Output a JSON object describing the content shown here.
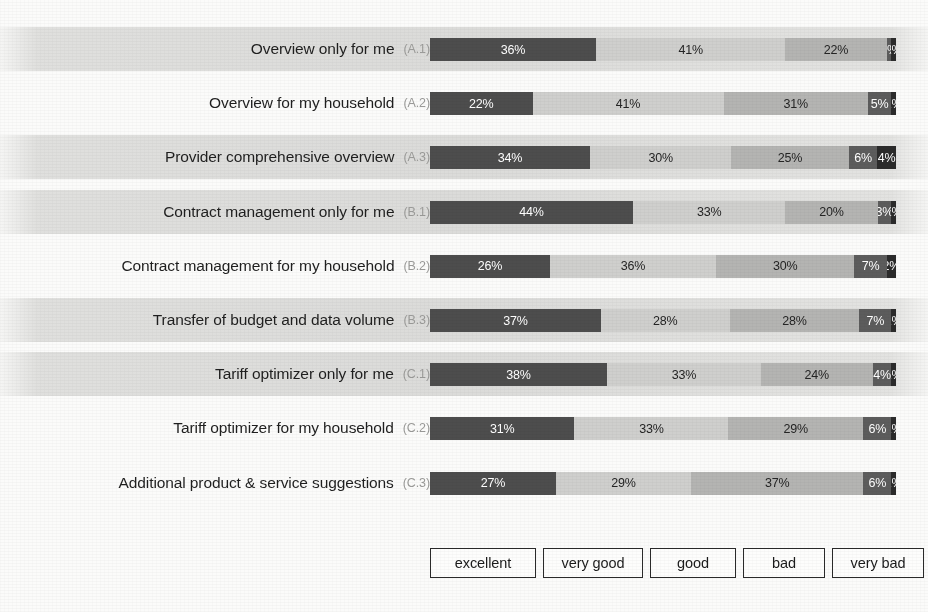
{
  "chart_data": {
    "type": "bar",
    "subtype": "horizontal-100-percent-stacked",
    "title": "",
    "xlabel": "",
    "ylabel": "",
    "xlim": [
      0,
      100
    ],
    "grid": false,
    "legend_position": "bottom",
    "value_suffix": "%",
    "categories": [
      "Overview only for me",
      "Overview for my household",
      "Provider comprehensive overview",
      "Contract management only for me",
      "Contract management for my household",
      "Transfer of budget and data volume",
      "Tariff optimizer only for me",
      "Tariff optimizer for my household",
      "Additional product & service suggestions"
    ],
    "category_codes": [
      "(A.1)",
      "(A.2)",
      "(A.3)",
      "(B.1)",
      "(B.2)",
      "(B.3)",
      "(C.1)",
      "(C.2)",
      "(C.3)"
    ],
    "series": [
      {
        "name": "excellent",
        "color": "#4d4d4d",
        "values": [
          36,
          22,
          34,
          44,
          26,
          37,
          38,
          31,
          27
        ]
      },
      {
        "name": "very good",
        "color": "#cfcfcd",
        "values": [
          41,
          41,
          30,
          33,
          36,
          28,
          33,
          33,
          29
        ]
      },
      {
        "name": "good",
        "color": "#b4b4b2",
        "values": [
          22,
          31,
          25,
          20,
          30,
          28,
          24,
          29,
          37
        ]
      },
      {
        "name": "bad",
        "color": "#5c5c5c",
        "values": [
          1,
          5,
          6,
          3,
          7,
          7,
          4,
          6,
          6
        ]
      },
      {
        "name": "very bad",
        "color": "#2b2b2b",
        "values": [
          1,
          1,
          4,
          1,
          2,
          1,
          1,
          1,
          1
        ]
      }
    ],
    "rows": [
      {
        "label": "Overview only for me",
        "code": "(A.1)",
        "band": true,
        "segments": [
          {
            "series": "excellent",
            "value": 36,
            "label": "36%"
          },
          {
            "series": "very good",
            "value": 41,
            "label": "41%"
          },
          {
            "series": "good",
            "value": 22,
            "label": "22%"
          },
          {
            "series": "bad",
            "value": 1,
            "label": "1%"
          },
          {
            "series": "very bad",
            "value": 1,
            "label": "1%"
          }
        ]
      },
      {
        "label": "Overview for my household",
        "code": "(A.2)",
        "band": false,
        "segments": [
          {
            "series": "excellent",
            "value": 22,
            "label": "22%"
          },
          {
            "series": "very good",
            "value": 41,
            "label": "41%"
          },
          {
            "series": "good",
            "value": 31,
            "label": "31%"
          },
          {
            "series": "bad",
            "value": 5,
            "label": "5%"
          },
          {
            "series": "very bad",
            "value": 1,
            "label": "1%"
          }
        ]
      },
      {
        "label": "Provider comprehensive overview",
        "code": "(A.3)",
        "band": true,
        "segments": [
          {
            "series": "excellent",
            "value": 34,
            "label": "34%"
          },
          {
            "series": "very good",
            "value": 30,
            "label": "30%"
          },
          {
            "series": "good",
            "value": 25,
            "label": "25%"
          },
          {
            "series": "bad",
            "value": 6,
            "label": "6%"
          },
          {
            "series": "very bad",
            "value": 4,
            "label": "4%"
          }
        ]
      },
      {
        "label": "Contract management only for me",
        "code": "(B.1)",
        "band": true,
        "segments": [
          {
            "series": "excellent",
            "value": 44,
            "label": "44%"
          },
          {
            "series": "very good",
            "value": 33,
            "label": "33%"
          },
          {
            "series": "good",
            "value": 20,
            "label": "20%"
          },
          {
            "series": "bad",
            "value": 3,
            "label": "3%"
          },
          {
            "series": "very bad",
            "value": 1,
            "label": "1%"
          }
        ]
      },
      {
        "label": "Contract management for my household",
        "code": "(B.2)",
        "band": false,
        "segments": [
          {
            "series": "excellent",
            "value": 26,
            "label": "26%"
          },
          {
            "series": "very good",
            "value": 36,
            "label": "36%"
          },
          {
            "series": "good",
            "value": 30,
            "label": "30%"
          },
          {
            "series": "bad",
            "value": 7,
            "label": "7%"
          },
          {
            "series": "very bad",
            "value": 2,
            "label": "2%"
          }
        ]
      },
      {
        "label": "Transfer of budget and data volume",
        "code": "(B.3)",
        "band": true,
        "segments": [
          {
            "series": "excellent",
            "value": 37,
            "label": "37%"
          },
          {
            "series": "very good",
            "value": 28,
            "label": "28%"
          },
          {
            "series": "good",
            "value": 28,
            "label": "28%"
          },
          {
            "series": "bad",
            "value": 7,
            "label": "7%"
          },
          {
            "series": "very bad",
            "value": 1,
            "label": "1%"
          }
        ]
      },
      {
        "label": "Tariff optimizer only for me",
        "code": "(C.1)",
        "band": true,
        "segments": [
          {
            "series": "excellent",
            "value": 38,
            "label": "38%"
          },
          {
            "series": "very good",
            "value": 33,
            "label": "33%"
          },
          {
            "series": "good",
            "value": 24,
            "label": "24%"
          },
          {
            "series": "bad",
            "value": 4,
            "label": "4%"
          },
          {
            "series": "very bad",
            "value": 1,
            "label": "1%"
          }
        ]
      },
      {
        "label": "Tariff optimizer for my household",
        "code": "(C.2)",
        "band": false,
        "segments": [
          {
            "series": "excellent",
            "value": 31,
            "label": "31%"
          },
          {
            "series": "very good",
            "value": 33,
            "label": "33%"
          },
          {
            "series": "good",
            "value": 29,
            "label": "29%"
          },
          {
            "series": "bad",
            "value": 6,
            "label": "6%"
          },
          {
            "series": "very bad",
            "value": 1,
            "label": "1%"
          }
        ]
      },
      {
        "label": "Additional product & service suggestions",
        "code": "(C.3)",
        "band": false,
        "segments": [
          {
            "series": "excellent",
            "value": 27,
            "label": "27%"
          },
          {
            "series": "very good",
            "value": 29,
            "label": "29%"
          },
          {
            "series": "good",
            "value": 37,
            "label": "37%"
          },
          {
            "series": "bad",
            "value": 6,
            "label": "6%"
          },
          {
            "series": "very bad",
            "value": 1,
            "label": "1%"
          }
        ]
      }
    ],
    "legend": [
      {
        "label": "excellent",
        "color": "#4d4d4d"
      },
      {
        "label": "very good",
        "color": "#cfcfcd"
      },
      {
        "label": "good",
        "color": "#b4b4b2"
      },
      {
        "label": "bad",
        "color": "#5c5c5c"
      },
      {
        "label": "very bad",
        "color": "#2b2b2b"
      }
    ]
  },
  "colors": {
    "excellent": "#4d4d4d",
    "very_good": "#cfcfcd",
    "good": "#b4b4b2",
    "bad": "#5c5c5c",
    "very_bad": "#2b2b2b",
    "band": "#dbdbd9",
    "page": "#fbfbfa"
  }
}
